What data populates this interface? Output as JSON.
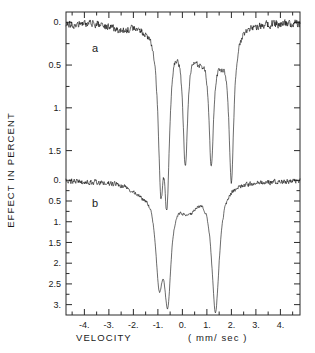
{
  "figure": {
    "panel_a_label": "a",
    "panel_b_label": "b"
  },
  "axes": {
    "ylabel": "EFFECT IN PERCENT",
    "xlabel_main": "VELOCITY",
    "xlabel_units": "( mm/ sec )"
  },
  "chart_data": {
    "type": "line",
    "title": "",
    "subtitle": "",
    "xlabel": "VELOCITY ( mm/ sec )",
    "ylabel": "EFFECT IN PERCENT",
    "grid": false,
    "legend": null,
    "xlim": [
      -4.75,
      4.8
    ],
    "xticks": [
      -4,
      -3,
      -2,
      -1,
      0,
      1,
      2,
      3,
      4
    ],
    "xticklabels": [
      "-4.",
      "-3.",
      "-2.",
      "-1.",
      "0.",
      "1.",
      "2.",
      "3.",
      "4."
    ],
    "minor_xtick_step": 0.5,
    "panels": [
      {
        "name": "a",
        "label": "a",
        "ylim": [
          1.75,
          -0.12
        ],
        "yticks": [
          0.0,
          0.5,
          1.0,
          1.5
        ],
        "yticklabels": [
          "0.",
          "0.5",
          "1.",
          "1.5"
        ],
        "minor_ytick_step": 0.25,
        "baseline_percent": 0.0,
        "peaks": [
          {
            "center": -0.88,
            "depth": 1.62,
            "width": 0.13
          },
          {
            "center": -0.63,
            "depth": 1.78,
            "width": 0.13
          },
          {
            "center": 0.12,
            "depth": 1.52,
            "width": 0.12
          },
          {
            "center": 1.18,
            "depth": 1.46,
            "width": 0.12
          },
          {
            "center": 2.0,
            "depth": 1.72,
            "width": 0.12
          },
          {
            "center": -2.55,
            "depth": 0.06,
            "width": 0.55
          },
          {
            "center": 0.7,
            "depth": 0.3,
            "width": 0.3
          },
          {
            "center": 1.6,
            "depth": 0.26,
            "width": 0.28
          }
        ],
        "noise_amplitude": 0.045
      },
      {
        "name": "b",
        "label": "b",
        "ylim": [
          3.25,
          -0.2
        ],
        "yticks": [
          0.0,
          0.5,
          1.0,
          1.5,
          2.0,
          2.5,
          3.0
        ],
        "yticklabels": [
          "0.",
          "0.5",
          "1.",
          "1.5",
          "2.",
          "2.5",
          "3."
        ],
        "minor_ytick_step": 0.25,
        "baseline_percent": 0.0,
        "peaks": [
          {
            "center": -0.95,
            "depth": 2.05,
            "width": 0.17
          },
          {
            "center": -0.6,
            "depth": 2.52,
            "width": 0.17
          },
          {
            "center": 1.35,
            "depth": 3.05,
            "width": 0.19
          },
          {
            "center": 0.25,
            "depth": 0.62,
            "width": 0.45
          },
          {
            "center": -1.7,
            "depth": 0.22,
            "width": 0.5
          }
        ],
        "noise_amplitude": 0.06
      }
    ]
  }
}
